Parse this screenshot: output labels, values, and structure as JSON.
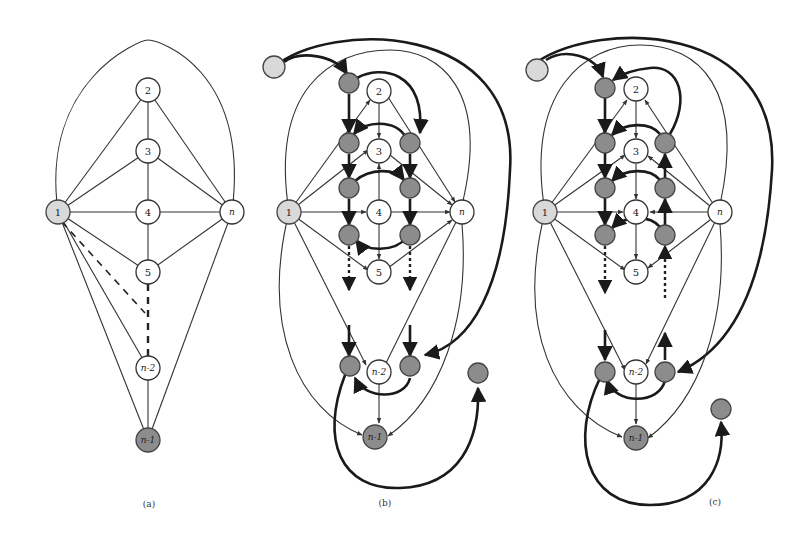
{
  "figure": {
    "panels": [
      {
        "id": "a",
        "caption": "(a)",
        "nodes": [
          {
            "label": "1",
            "style": "light"
          },
          {
            "label": "2",
            "style": "white"
          },
          {
            "label": "3",
            "style": "white"
          },
          {
            "label": "4",
            "style": "white"
          },
          {
            "label": "5",
            "style": "white"
          },
          {
            "label": "n",
            "style": "white"
          },
          {
            "label": "n-2",
            "style": "white"
          },
          {
            "label": "n-1",
            "style": "dark"
          }
        ]
      },
      {
        "id": "b",
        "caption": "(b)",
        "nodes": [
          {
            "label": "1",
            "style": "light"
          },
          {
            "label": "2",
            "style": "white"
          },
          {
            "label": "3",
            "style": "white"
          },
          {
            "label": "4",
            "style": "white"
          },
          {
            "label": "5",
            "style": "white"
          },
          {
            "label": "n",
            "style": "white"
          },
          {
            "label": "n-2",
            "style": "white"
          },
          {
            "label": "n-1",
            "style": "dark"
          }
        ]
      },
      {
        "id": "c",
        "caption": "(c)",
        "nodes": [
          {
            "label": "1",
            "style": "light"
          },
          {
            "label": "2",
            "style": "white"
          },
          {
            "label": "3",
            "style": "white"
          },
          {
            "label": "4",
            "style": "white"
          },
          {
            "label": "5",
            "style": "white"
          },
          {
            "label": "n",
            "style": "white"
          },
          {
            "label": "n-2",
            "style": "white"
          },
          {
            "label": "n-1",
            "style": "dark"
          }
        ]
      }
    ]
  }
}
